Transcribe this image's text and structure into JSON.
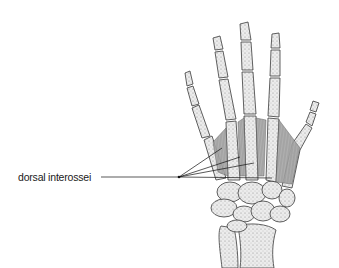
{
  "diagram": {
    "labels": [
      {
        "id": "dorsal-interossei",
        "text": "dorsal interossei",
        "leader_lines": 4
      }
    ]
  },
  "colors": {
    "bone_fill": "#e9e9e9",
    "bone_stroke": "#3a3a3a",
    "bone_stipple": "#8a8a8a",
    "muscle_fill": "#9a9a9a",
    "leader_line": "#111111",
    "text": "#1a1a1a"
  }
}
